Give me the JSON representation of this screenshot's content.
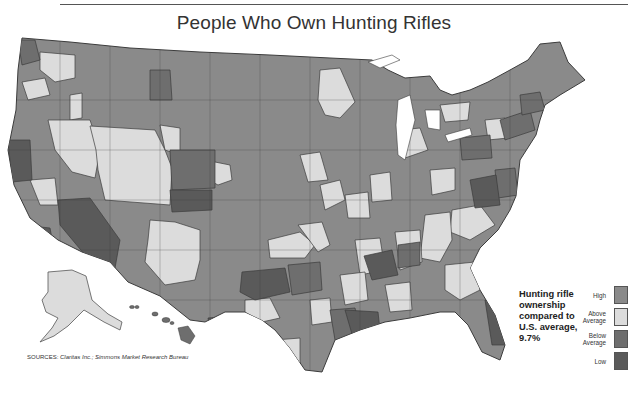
{
  "title": "People Who Own Hunting Rifles",
  "note": {
    "line1": "Hunting rifle",
    "line2": "ownership",
    "line3": "compared to",
    "line4": "U.S. average,",
    "line5": "9.7%"
  },
  "legend": {
    "items": [
      {
        "label_1": "High",
        "label_2": "",
        "color": "#8a8a8a"
      },
      {
        "label_1": "Above",
        "label_2": "Average",
        "color": "#dcdcdc"
      },
      {
        "label_1": "Below",
        "label_2": "Average",
        "color": "#6e6e6e"
      },
      {
        "label_1": "Low",
        "label_2": "",
        "color": "#5a5a5a"
      }
    ]
  },
  "sources": {
    "label": "SOURCES:",
    "text": "Claritas Inc.; Simmons Market Research Bureau"
  },
  "colors": {
    "high": "#8a8a8a",
    "above_average": "#dcdcdc",
    "below_average": "#6e6e6e",
    "low": "#5a5a5a",
    "border": "#3c3c3c"
  }
}
